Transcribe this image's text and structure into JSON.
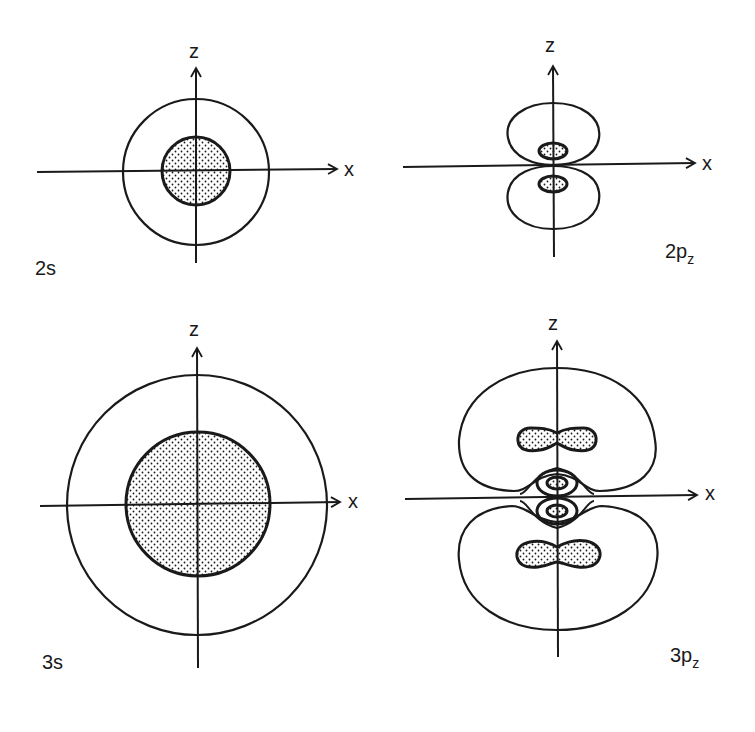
{
  "figure": {
    "title": "",
    "colors": {
      "line": "#1a1a1a",
      "background": "#ffffff",
      "stipple": "#1a1a1a"
    }
  },
  "panels": [
    {
      "id": "2s",
      "label_main": "2s",
      "label_sub": "",
      "axis_x": "x",
      "axis_z": "z",
      "contours": [
        "outer circle (unshaded)",
        "inner circle (stippled)"
      ]
    },
    {
      "id": "2pz",
      "label_main": "2p",
      "label_sub": "z",
      "axis_x": "x",
      "axis_z": "z",
      "contours": [
        "upper lobe",
        "lower lobe",
        "upper inner stippled ellipse",
        "lower inner stippled ellipse"
      ]
    },
    {
      "id": "3s",
      "label_main": "3s",
      "label_sub": "",
      "axis_x": "x",
      "axis_z": "z",
      "contours": [
        "outer circle (unshaded)",
        "inner circle (stippled)"
      ]
    },
    {
      "id": "3pz",
      "label_main": "3p",
      "label_sub": "z",
      "axis_x": "x",
      "axis_z": "z",
      "contours": [
        "upper outer lobe",
        "lower outer lobe",
        "upper stippled crescent",
        "lower stippled crescent",
        "inner nested lobes near origin"
      ]
    }
  ]
}
